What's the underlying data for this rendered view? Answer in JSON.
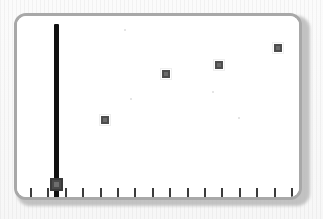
{
  "widget": {
    "name": "slider-scatter-panel",
    "title": "Vertical slider with scatter plot",
    "panel_border_color": "#a8a8a8",
    "panel_background": "#ffffff",
    "page_background": "#fbfbfb",
    "shadow_color": "#b9b9b9"
  },
  "slider": {
    "name": "vertical-slider",
    "orientation": "vertical",
    "track_color": "#101010",
    "thumb_color": "#4a4a4a",
    "thumb_core_color": "#6e6e6e",
    "track_x": 53,
    "track_top": 21,
    "track_bottom": 197,
    "thumb_center_y": 181,
    "value_label": "",
    "min_label": "",
    "max_label": ""
  },
  "chart_data": {
    "type": "scatter",
    "title": "",
    "subtitle": "",
    "xlabel": "",
    "ylabel": "",
    "grid": false,
    "legend": null,
    "marker_color": "#6b6b6b",
    "marker_border_color": "#4d4d4d",
    "x": [
      4,
      8,
      11,
      14
    ],
    "y": [
      32,
      60,
      68,
      80
    ],
    "values": [
      32,
      60,
      68,
      80
    ],
    "categories": [
      "4",
      "8",
      "11",
      "14"
    ],
    "xlim": [
      0,
      16
    ],
    "ylim": [
      0,
      100
    ],
    "points": [
      {
        "x": 4,
        "y": 32,
        "px": 102,
        "py": 117
      },
      {
        "x": 8,
        "y": 60,
        "px": 163,
        "py": 71
      },
      {
        "x": 11,
        "y": 68,
        "px": 216,
        "py": 62
      },
      {
        "x": 14,
        "y": 80,
        "px": 275,
        "py": 45
      }
    ]
  },
  "axis": {
    "name": "x-axis",
    "tick_color": "#3b3b3b",
    "tick_count": 16,
    "tick_first_x": 27,
    "tick_spacing": 17.4,
    "tick_top": 185,
    "tick_height": 9,
    "tick_labels": [
      "",
      "",
      "",
      "",
      "",
      "",
      "",
      "",
      "",
      "",
      "",
      "",
      "",
      "",
      "",
      ""
    ]
  },
  "specks": [
    {
      "x": 122,
      "y": 27,
      "r": 1.2
    },
    {
      "x": 210,
      "y": 89,
      "r": 1.0
    },
    {
      "x": 128,
      "y": 96,
      "r": 1.0
    },
    {
      "x": 236,
      "y": 115,
      "r": 0.9
    }
  ]
}
